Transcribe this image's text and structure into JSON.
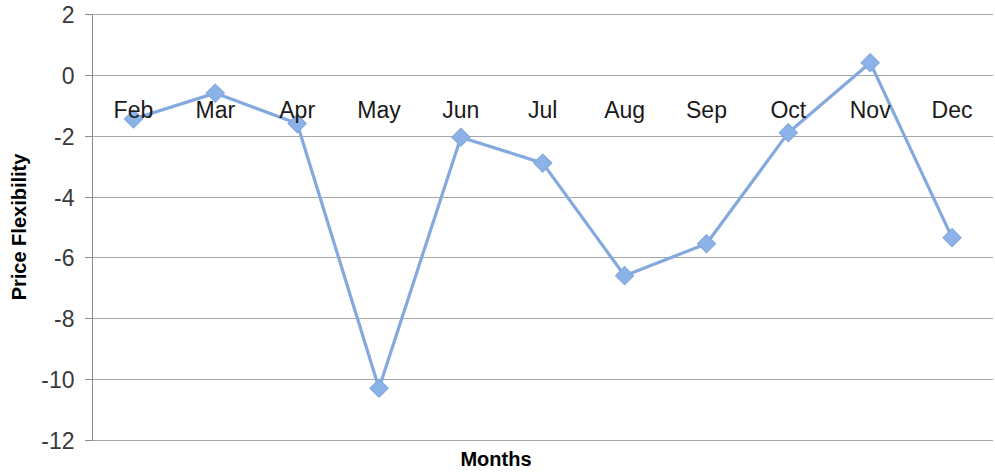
{
  "chart_data": {
    "type": "line",
    "title": "",
    "xlabel": "Months",
    "ylabel": "Price Flexibility",
    "categories": [
      "Feb",
      "Mar",
      "Apr",
      "May",
      "Jun",
      "Jul",
      "Aug",
      "Sep",
      "Oct",
      "Nov",
      "Dec"
    ],
    "values": [
      -1.45,
      -0.6,
      -1.6,
      -10.3,
      -2.05,
      -2.9,
      -6.6,
      -5.55,
      -1.9,
      0.4,
      -5.35
    ],
    "series": [
      {
        "name": "Price Flexibility",
        "values": [
          -1.45,
          -0.6,
          -1.6,
          -10.3,
          -2.05,
          -2.9,
          -6.6,
          -5.55,
          -1.9,
          0.4,
          -5.35
        ]
      }
    ],
    "ylim": [
      -12,
      2
    ],
    "ytick_labels": [
      "2",
      "0",
      "-2",
      "-4",
      "-6",
      "-8",
      "-10",
      "-12"
    ],
    "yticks": [
      2,
      0,
      -2,
      -4,
      -6,
      -8,
      -10,
      -12
    ],
    "grid": true,
    "legend": "none",
    "marker": "diamond",
    "line_color": "#84A9DD",
    "marker_color": "#8CB3E8",
    "gridline_color": "#A6A6A6",
    "axis_color": "#8C8C8C",
    "background": "#FFFFFF"
  }
}
